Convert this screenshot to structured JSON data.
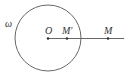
{
  "diagram": {
    "circle_label": "ω",
    "center_label": "O",
    "inner_point_label": "M′",
    "outer_point_label": "M",
    "stroke_color": "#555555",
    "point_color": "#333333"
  }
}
